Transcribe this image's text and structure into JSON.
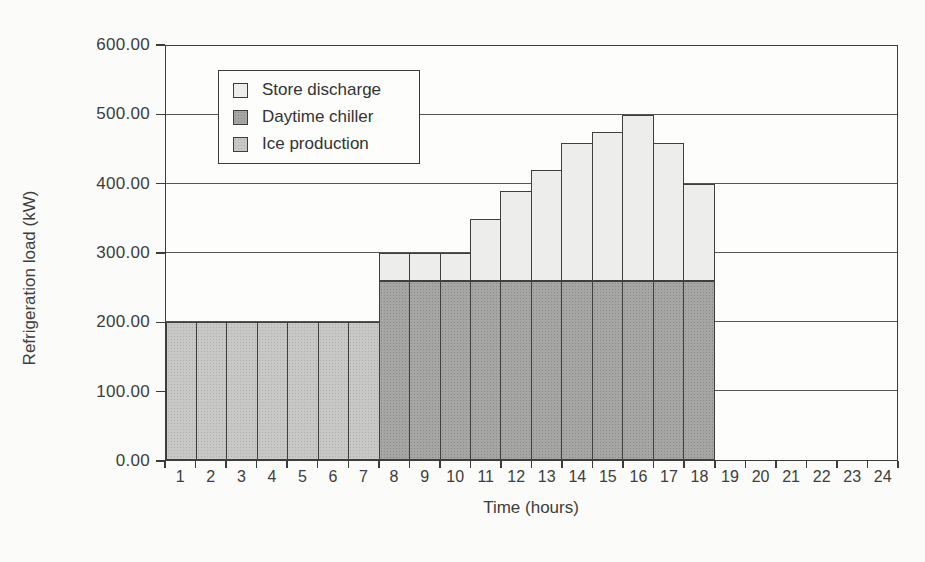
{
  "chart_data": {
    "type": "bar",
    "stacked": true,
    "title": "",
    "xlabel": "Time (hours)",
    "ylabel": "Refrigeration load (kW)",
    "categories": [
      1,
      2,
      3,
      4,
      5,
      6,
      7,
      8,
      9,
      10,
      11,
      12,
      13,
      14,
      15,
      16,
      17,
      18,
      19,
      20,
      21,
      22,
      23,
      24
    ],
    "series": [
      {
        "name": "Store discharge",
        "color": "#ededec",
        "values": [
          0,
          0,
          0,
          0,
          0,
          0,
          0,
          40,
          40,
          40,
          90,
          130,
          160,
          200,
          215,
          240,
          200,
          140,
          0,
          0,
          0,
          0,
          0,
          0
        ]
      },
      {
        "name": "Daytime chiller",
        "color": "#a6a6a4",
        "values": [
          0,
          0,
          0,
          0,
          0,
          0,
          0,
          260,
          260,
          260,
          260,
          260,
          260,
          260,
          260,
          260,
          260,
          260,
          0,
          0,
          0,
          0,
          0,
          0
        ]
      },
      {
        "name": "Ice production",
        "color": "#c8c8c6",
        "values": [
          200,
          200,
          200,
          200,
          200,
          200,
          200,
          0,
          0,
          0,
          0,
          0,
          0,
          0,
          0,
          0,
          0,
          0,
          0,
          0,
          0,
          0,
          0,
          0
        ]
      }
    ],
    "ylim": [
      0,
      600
    ],
    "ytick_step": 100,
    "ytick_labels": [
      "0.00",
      "100.00",
      "200.00",
      "300.00",
      "400.00",
      "500.00",
      "600.00"
    ],
    "grid": true,
    "legend_position": "inside-top-left",
    "axis_color": "#3c3c3c",
    "background_color": "#fbfbf9"
  }
}
